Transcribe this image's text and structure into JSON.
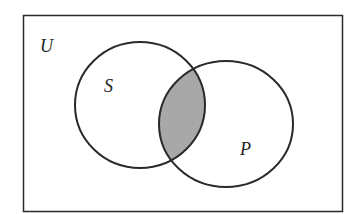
{
  "diagram": {
    "type": "venn",
    "universe_label": "U",
    "sets": [
      {
        "label": "S"
      },
      {
        "label": "P"
      }
    ],
    "shaded_region": "S ∩ P",
    "colors": {
      "outline": "#2a2a2a",
      "shade": "#a8a8a8",
      "background": "#ffffff"
    }
  }
}
